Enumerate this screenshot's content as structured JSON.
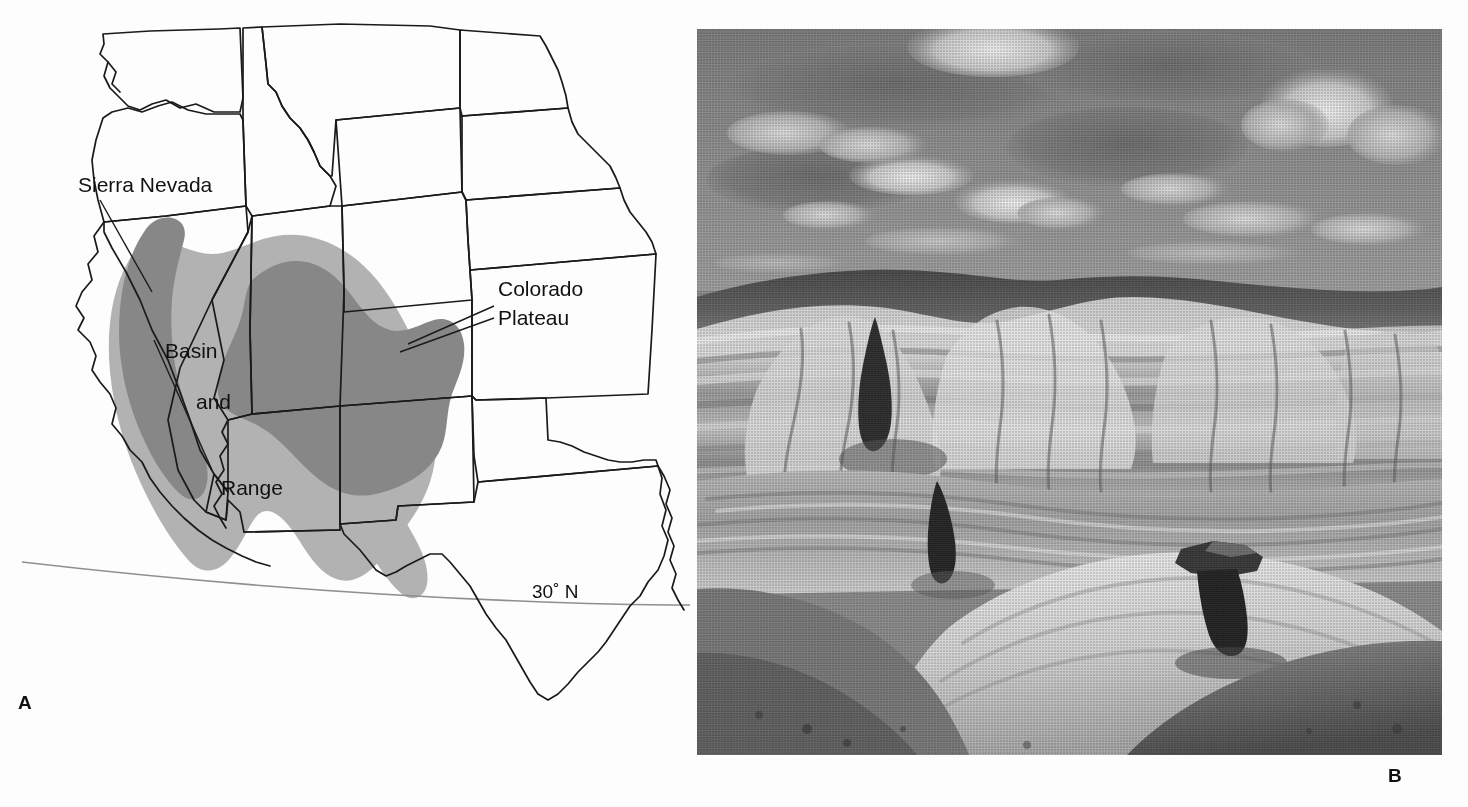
{
  "figure": {
    "type": "two-panel-figure",
    "background_color": "#fdfdfd"
  },
  "panel_a": {
    "letter": "A",
    "kind": "map",
    "description": "Outline map of the western United States showing the Basin and Range province and the Colorado Plateau",
    "colors": {
      "outline": "#1a1a1a",
      "basin_and_range_fill": "#b2b2b2",
      "colorado_plateau_fill": "#878787",
      "sierra_nevada_fill": "#878787",
      "latitude_line": "#8f8f8f",
      "land_fill": "#ffffff"
    },
    "labels": [
      {
        "id": "sierra-nevada",
        "text": "Sierra Nevada",
        "x": 78,
        "y": 192
      },
      {
        "id": "basin",
        "text": "Basin",
        "x": 165,
        "y": 358
      },
      {
        "id": "and",
        "text": "and",
        "x": 196,
        "y": 409
      },
      {
        "id": "range",
        "text": "Range",
        "x": 221,
        "y": 495
      },
      {
        "id": "colorado",
        "text": "Colorado",
        "x": 498,
        "y": 296
      },
      {
        "id": "plateau",
        "text": "Plateau",
        "x": 498,
        "y": 325
      },
      {
        "id": "latitude",
        "text": "30˚ N",
        "x": 532,
        "y": 598
      }
    ],
    "legend_regions": [
      {
        "name": "Basin and Range",
        "shade": "light gray",
        "hex": "#b2b2b2"
      },
      {
        "name": "Colorado Plateau",
        "shade": "dark gray",
        "hex": "#878787"
      },
      {
        "name": "Sierra Nevada",
        "shade": "dark gray",
        "hex": "#878787"
      }
    ],
    "graticule": {
      "label": "30˚ N",
      "type": "latitude-line"
    }
  },
  "panel_b": {
    "letter": "B",
    "kind": "photograph",
    "description": "Black-and-white photograph of banded badlands terrain with a dark capped hoodoo in the foreground and cumulus clouds overhead",
    "colors": {
      "sky": "#8a8a8a",
      "cloud_highlight": "#e2e2e2",
      "mesa_dark": "#4a4a4a",
      "badlands_light": "#d6d6d6",
      "badlands_mid": "#9d9d9d",
      "hoodoo_dark": "#2b2b2b",
      "foreground_slope": "#6e6e6e"
    }
  }
}
